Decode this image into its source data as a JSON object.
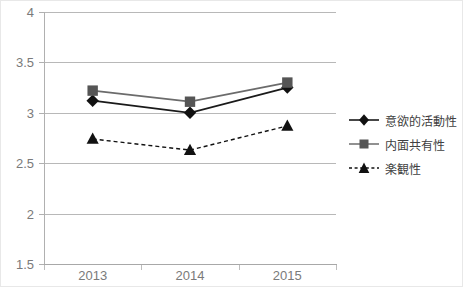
{
  "chart_data": {
    "type": "line",
    "title": "",
    "xlabel": "",
    "ylabel": "",
    "categories": [
      "2013",
      "2014",
      "2015"
    ],
    "ylim": [
      1.5,
      4
    ],
    "yticks": [
      4,
      3.5,
      3,
      2.5,
      2,
      1.5
    ],
    "ytick_labels": [
      "4",
      "3.5",
      "3",
      "2.5",
      "2",
      "1.5"
    ],
    "grid": true,
    "legend_position": "right",
    "series": [
      {
        "name": "意欲的活動性",
        "values": [
          3.12,
          3.0,
          3.25
        ],
        "marker": "diamond",
        "color": "#1a1a1a",
        "line_style": "solid"
      },
      {
        "name": "内面共有性",
        "values": [
          3.22,
          3.11,
          3.3
        ],
        "marker": "square",
        "color": "#6b6b6b",
        "line_style": "solid"
      },
      {
        "name": "楽観性",
        "values": [
          2.74,
          2.63,
          2.87
        ],
        "marker": "triangle",
        "color": "#111111",
        "line_style": "dashed"
      }
    ]
  },
  "axes": {
    "y_labels": [
      "4",
      "3.5",
      "3",
      "2.5",
      "2",
      "1.5"
    ],
    "x_labels": [
      "2013",
      "2014",
      "2015"
    ]
  },
  "legend": {
    "items": [
      {
        "label": "意欲的活動性"
      },
      {
        "label": "内面共有性"
      },
      {
        "label": "楽観性"
      }
    ]
  },
  "colors": {
    "series_1": "#1a1a1a",
    "series_2": "#6b6b6b",
    "series_3": "#111111",
    "gridline": "#b8b8b8",
    "tick_text": "#7a7a7a",
    "legend_text": "#404040",
    "background": "#ffffff"
  }
}
